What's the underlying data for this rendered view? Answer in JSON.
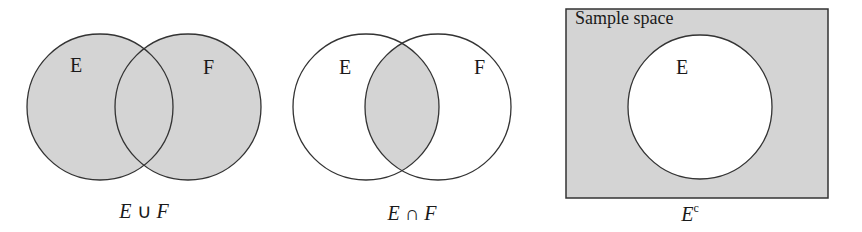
{
  "colors": {
    "shade": "#d4d4d4",
    "stroke": "#333333",
    "background": "#ffffff"
  },
  "diagrams": [
    {
      "id": "union",
      "set_labels": [
        "E",
        "F"
      ],
      "caption": {
        "left": "E",
        "op": "∪",
        "right": "F"
      },
      "shaded_region": "E ∪ F"
    },
    {
      "id": "intersection",
      "set_labels": [
        "E",
        "F"
      ],
      "caption": {
        "left": "E",
        "op": "∩",
        "right": "F"
      },
      "shaded_region": "E ∩ F"
    },
    {
      "id": "complement",
      "box_label": "Sample space",
      "set_labels": [
        "E"
      ],
      "caption": {
        "base": "E",
        "sup": "c"
      },
      "shaded_region": "E^c"
    }
  ]
}
